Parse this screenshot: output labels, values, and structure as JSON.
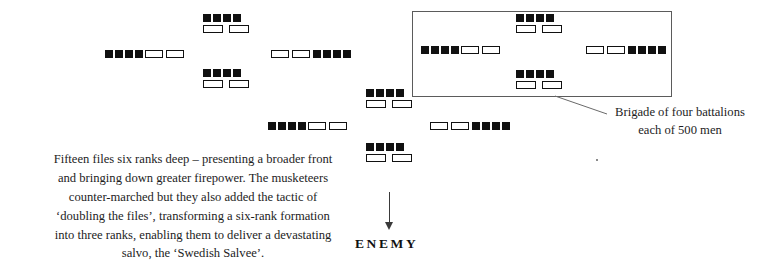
{
  "diagram": {
    "type": "military-formation-diagram",
    "title_text": "Swedish brigade deployment diagram",
    "colors": {
      "pike_fill": "#111111",
      "musket_fill": "#ffffff",
      "musket_stroke": "#111111",
      "box_stroke": "#5b5b5b",
      "leader_stroke": "#6a6a6a",
      "text": "#1d1d1d",
      "background": "#ffffff"
    },
    "symbol_legend": {
      "filled_square": "pike block",
      "hollow_rectangle": "musket sleeve"
    },
    "callout": {
      "line_1": "Brigade of four battalions",
      "line_2": "each of 500 men"
    },
    "paragraph": {
      "line_1": "Fifteen files six ranks deep – presenting a broader front",
      "line_2": "and bringing down greater firepower. The musketeers",
      "line_3": "counter-marched but they also added the tactic of",
      "line_4": "‘doubling the files’, transforming a six-rank formation",
      "line_5": "into three ranks, enabling them to deliver a devastating",
      "line_6": "salvo, the ‘Swedish Salvee’."
    },
    "enemy": {
      "label": "ENEMY",
      "arrow_direction": "down"
    },
    "units": [
      {
        "id": "left-brigade-front",
        "arrangement": "horizontal",
        "order": "pikes-then-muskets",
        "pikes": 4,
        "muskets": 2
      },
      {
        "id": "left-brigade-top",
        "arrangement": "stacked",
        "pikes": 4,
        "muskets": 2
      },
      {
        "id": "left-brigade-bottom",
        "arrangement": "stacked",
        "pikes": 4,
        "muskets": 2
      },
      {
        "id": "left-brigade-rear",
        "arrangement": "horizontal",
        "order": "muskets-then-pikes",
        "pikes": 4,
        "muskets": 2
      },
      {
        "id": "centre-brigade-top",
        "arrangement": "stacked",
        "pikes": 4,
        "muskets": 2
      },
      {
        "id": "centre-brigade-front",
        "arrangement": "horizontal",
        "order": "pikes-then-muskets",
        "pikes": 4,
        "muskets": 2
      },
      {
        "id": "centre-brigade-rear",
        "arrangement": "horizontal",
        "order": "muskets-then-pikes",
        "pikes": 4,
        "muskets": 2
      },
      {
        "id": "centre-brigade-bottom",
        "arrangement": "stacked",
        "pikes": 4,
        "muskets": 2
      },
      {
        "id": "boxed-brigade-top",
        "arrangement": "stacked",
        "pikes": 4,
        "muskets": 2
      },
      {
        "id": "boxed-brigade-front",
        "arrangement": "horizontal",
        "order": "pikes-then-muskets",
        "pikes": 4,
        "muskets": 2
      },
      {
        "id": "boxed-brigade-rear",
        "arrangement": "horizontal",
        "order": "muskets-then-pikes",
        "pikes": 4,
        "muskets": 2
      },
      {
        "id": "boxed-brigade-bottom",
        "arrangement": "stacked",
        "pikes": 4,
        "muskets": 2
      }
    ]
  }
}
